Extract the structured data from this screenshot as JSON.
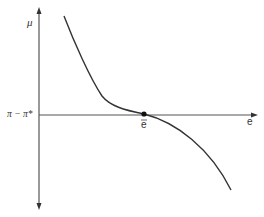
{
  "diagram": {
    "y_axis_label": "μ",
    "x_axis_label": "e",
    "y_intercept_label": "π − π*",
    "equilibrium_label": "e",
    "equilibrium_label_overbar": true,
    "colors": {
      "axis": "#555555",
      "curve": "#333333",
      "point": "#111111",
      "background": "#ffffff"
    },
    "curve_points": [
      [
        64,
        16
      ],
      [
        76,
        44
      ],
      [
        88,
        70
      ],
      [
        98,
        90
      ],
      [
        104,
        98
      ],
      [
        112,
        104
      ],
      [
        124,
        109
      ],
      [
        136,
        112
      ],
      [
        144,
        114
      ],
      [
        156,
        118
      ],
      [
        170,
        124
      ],
      [
        186,
        134
      ],
      [
        200,
        146
      ],
      [
        214,
        162
      ],
      [
        224,
        177
      ],
      [
        231,
        190
      ]
    ],
    "equilibrium_point": [
      144,
      114
    ]
  }
}
